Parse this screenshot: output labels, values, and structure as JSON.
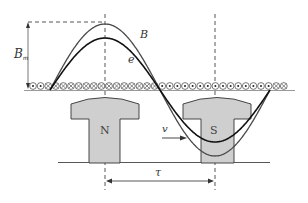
{
  "diagram": {
    "type": "electrical-machine-flux-and-emf-waveform",
    "labels": {
      "flux_density_curve": "B",
      "emf_curve": "e",
      "amplitude_main": "B",
      "amplitude_sub": "m",
      "north_pole": "N",
      "south_pole": "S",
      "velocity": "v",
      "pole_pitch": "τ"
    },
    "colors": {
      "line": "#333333",
      "b_curve": "#4a4a4a",
      "e_curve": "#111111",
      "pole_fill": "#cfcfcf",
      "dashed": "#444444",
      "baseline": "#9a9a9a"
    },
    "geometry": {
      "pole_centers_x": [
        105,
        215
      ],
      "baseline_y": 90,
      "top_dashed_y": 22,
      "b_amplitude_px": 66,
      "e_amplitude_px": 52,
      "wave_start_x": 50,
      "wave_end_x": 270
    },
    "conductors": {
      "start_x": 33,
      "pitch": 7.6,
      "pattern": [
        "dot",
        "dot",
        "cross",
        "cross",
        "cross",
        "cross",
        "cross",
        "cross",
        "cross",
        "cross",
        "cross",
        "cross",
        "cross",
        "cross",
        "cross",
        "cross",
        "cross",
        "dot",
        "dot",
        "dot",
        "dot",
        "dot",
        "dot",
        "dot",
        "dot",
        "dot",
        "dot",
        "dot",
        "dot",
        "dot",
        "dot",
        "dot",
        "cross",
        "cross"
      ]
    }
  }
}
